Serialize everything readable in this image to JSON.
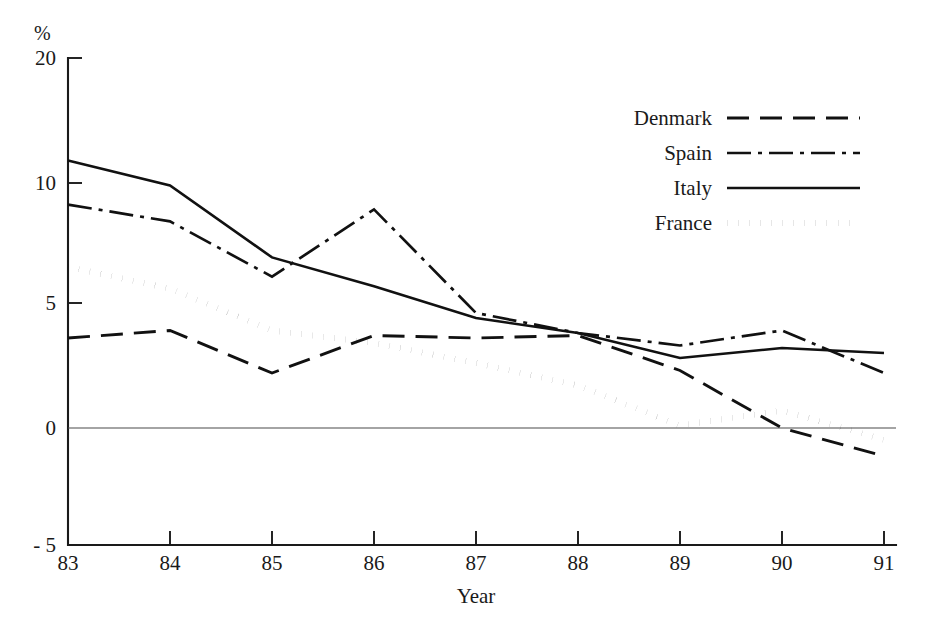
{
  "chart_data": {
    "type": "line",
    "title": "",
    "xlabel": "Year",
    "ylabel": "%",
    "unit_label": "%",
    "x": [
      "83",
      "84",
      "85",
      "86",
      "87",
      "88",
      "89",
      "90",
      "91"
    ],
    "categories": [
      "83",
      "84",
      "85",
      "86",
      "87",
      "88",
      "89",
      "90",
      "91"
    ],
    "xlim": [
      83,
      91
    ],
    "ylim": [
      -5,
      20
    ],
    "y_ticks": [
      20,
      10,
      5,
      0,
      -5
    ],
    "y_tick_labels": [
      "20",
      "10",
      "5",
      "0",
      "- 5"
    ],
    "x_ticks": [
      "83",
      "84",
      "85",
      "86",
      "87",
      "88",
      "89",
      "90",
      "91"
    ],
    "grid": false,
    "zero_line": true,
    "legend_position": "top-right",
    "series": [
      {
        "name": "Denmark",
        "style": "dashed",
        "values": [
          3.6,
          3.9,
          2.2,
          3.7,
          3.6,
          3.7,
          2.3,
          0.0,
          -1.2
        ]
      },
      {
        "name": "Spain",
        "style": "dash-dot",
        "values": [
          9.1,
          8.4,
          6.1,
          8.9,
          4.6,
          3.8,
          3.3,
          3.9,
          2.2
        ]
      },
      {
        "name": "Italy",
        "style": "solid",
        "values": [
          11.8,
          9.9,
          6.9,
          5.7,
          4.4,
          3.8,
          2.8,
          3.2,
          3.0
        ]
      },
      {
        "name": "France",
        "style": "dotted",
        "values": [
          6.5,
          5.6,
          3.9,
          3.4,
          2.6,
          1.7,
          0.1,
          0.7,
          -0.5
        ]
      }
    ]
  },
  "axes": {
    "y_unit": "%",
    "y_labels": [
      "20",
      "10",
      "5",
      "0",
      "- 5"
    ],
    "x_labels": [
      "83",
      "84",
      "85",
      "86",
      "87",
      "88",
      "89",
      "90",
      "91"
    ],
    "x_axis_title": "Year"
  },
  "legend": {
    "entries": [
      {
        "label": "Denmark",
        "style": "dashed"
      },
      {
        "label": "Spain",
        "style": "dash-dot"
      },
      {
        "label": "Italy",
        "style": "solid"
      },
      {
        "label": "France",
        "style": "dotted"
      }
    ]
  },
  "colors": {
    "ink": "#111111",
    "axis": "#1a1a1a",
    "zero_rule": "#4a4a4a",
    "background": "#ffffff"
  }
}
